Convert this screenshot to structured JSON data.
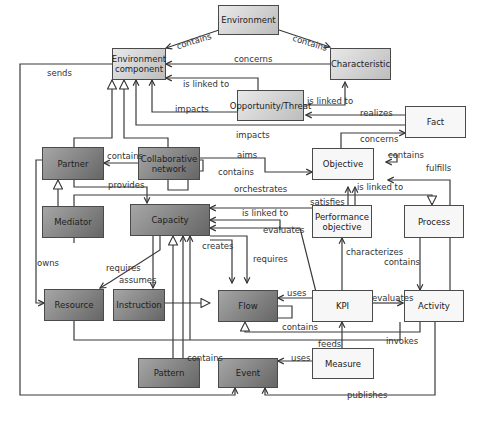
{
  "diagram": {
    "type": "UML class diagram (ontology / meta-model)",
    "nodes": {
      "environment": "Environment",
      "environment_component": "Environment component",
      "characteristic": "Characteristic",
      "opportunity_threat": "Opportunity/Threat",
      "fact": "Fact",
      "partner": "Partner",
      "collaborative_network": "Collaborative network",
      "objective": "Objective",
      "mediator": "Mediator",
      "capacity": "Capacity",
      "performance_objective": "Performance objective",
      "process": "Process",
      "resource": "Resource",
      "instruction": "Instruction",
      "flow": "Flow",
      "kpi": "KPI",
      "activity": "Activity",
      "pattern": "Pattern",
      "event": "Event",
      "measure": "Measure"
    },
    "labels": {
      "env_contains_envcomp": "contains",
      "env_contains_char": "contains",
      "concerns_top": "concerns",
      "sends": "sends",
      "is_linked_to_envcomp": "is linked to",
      "is_linked_to_char": "is linked to",
      "impacts_1": "impacts",
      "realizes": "realizes",
      "impacts_2": "impacts",
      "concerns_fact": "concerns",
      "partner_contains": "contains",
      "aims": "aims",
      "objective_contains": "contains",
      "fulfills": "fulfills",
      "collab_contains": "contains",
      "is_linked_to_obj": "is linked to",
      "provides": "provides",
      "orchestrates": "orchestrates",
      "satisfies": "satisfies",
      "is_linked_to_cap": "is linked to",
      "evaluates_cap": "evaluates",
      "owns": "owns",
      "creates": "creates",
      "requires_flow": "requires",
      "characterizes": "characterizes",
      "process_contains": "contains",
      "requires_res": "requires",
      "assumes": "assumes",
      "uses_flow": "uses",
      "evaluates_act": "evaluates",
      "flow_contains": "contains",
      "invokes": "invokes",
      "feeds": "feeds",
      "pattern_contains": "contains",
      "uses_event": "uses",
      "publishes": "publishes"
    }
  }
}
